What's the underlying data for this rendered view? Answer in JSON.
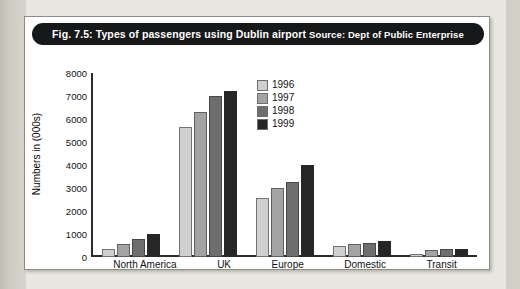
{
  "figure": {
    "title_main": "Fig. 7.5: Types of passengers using Dublin airport",
    "title_source": "Source: Dept of Public Enterprise"
  },
  "legend": {
    "position": "inside-top-center",
    "entries": [
      {
        "label": "1996",
        "color": "#cfcfcf"
      },
      {
        "label": "1997",
        "color": "#a3a3a3"
      },
      {
        "label": "1998",
        "color": "#6e6e6e"
      },
      {
        "label": "1999",
        "color": "#262626"
      }
    ]
  },
  "axes": {
    "ylabel": "Numbers in (000s)",
    "yticks": [
      "8000",
      "7000",
      "6000",
      "5000",
      "4000",
      "3000",
      "2000",
      "1000",
      "0"
    ]
  },
  "chart_data": {
    "type": "bar",
    "title": "Fig. 7.5: Types of passengers using Dublin airport",
    "subtitle": "Source: Dept of Public Enterprise",
    "xlabel": "",
    "ylabel": "Numbers in (000s)",
    "ylim": [
      0,
      8000
    ],
    "ytick_step": 1000,
    "grid": false,
    "legend_position": "inside-top-center",
    "categories": [
      "North America",
      "UK",
      "Europe",
      "Domestic",
      "Transit"
    ],
    "series": [
      {
        "name": "1996",
        "color": "#cfcfcf",
        "values": [
          350,
          5650,
          2550,
          500,
          150
        ]
      },
      {
        "name": "1997",
        "color": "#a3a3a3",
        "values": [
          550,
          6300,
          3000,
          550,
          300
        ]
      },
      {
        "name": "1998",
        "color": "#6e6e6e",
        "values": [
          800,
          7000,
          3250,
          600,
          330
        ]
      },
      {
        "name": "1999",
        "color": "#262626",
        "values": [
          1000,
          7200,
          4000,
          700,
          330
        ]
      }
    ]
  }
}
